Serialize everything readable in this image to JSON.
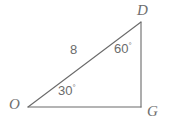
{
  "figure": {
    "type": "triangle-diagram",
    "background_color": "#ffffff",
    "stroke_color": "#6a6a6a",
    "text_color": "#6b6b6b",
    "width": 174,
    "height": 127
  },
  "vertices": [
    {
      "id": "D",
      "label": "D",
      "x": 141,
      "y": 22,
      "position": "top-right"
    },
    {
      "id": "O",
      "label": "O",
      "x": 28,
      "y": 107,
      "position": "bottom-left"
    },
    {
      "id": "G",
      "label": "G",
      "x": 141,
      "y": 107,
      "position": "bottom-right"
    }
  ],
  "sides": [
    {
      "id": "OD",
      "from": "O",
      "to": "D",
      "label": "8",
      "role": "hypotenuse"
    },
    {
      "id": "DG",
      "from": "D",
      "to": "G",
      "label": "",
      "role": "vertical-leg"
    },
    {
      "id": "OG",
      "from": "O",
      "to": "G",
      "label": "",
      "role": "horizontal-leg"
    }
  ],
  "angles": [
    {
      "at": "O",
      "value": "30",
      "unit": "°",
      "label": "30°"
    },
    {
      "at": "D",
      "value": "60",
      "unit": "°",
      "label": "60°"
    }
  ],
  "labels": {
    "vertex_D": "D",
    "vertex_O": "O",
    "vertex_G": "G",
    "side_OD": "8",
    "angle_O_value": "30",
    "angle_D_value": "60",
    "degree_symbol": "°"
  }
}
